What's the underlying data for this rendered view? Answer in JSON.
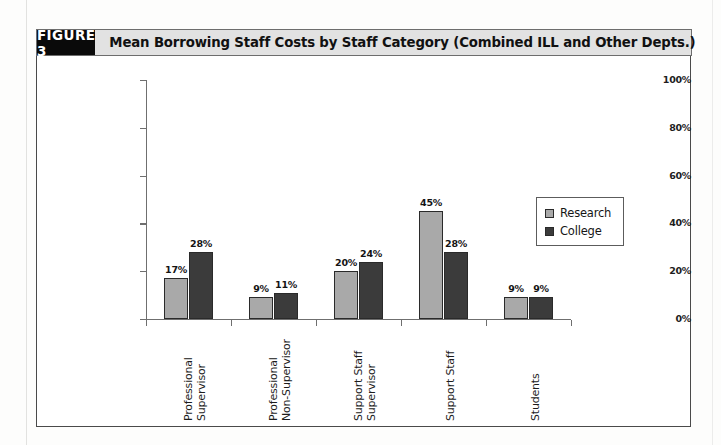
{
  "figure": {
    "number_label": "FIGURE 3",
    "title": "Mean Borrowing Staff Costs by Staff Category (Combined ILL and Other Depts.)"
  },
  "colors": {
    "research_bar": "#a9a9a9",
    "college_bar": "#3b3b3b",
    "header_number_bg": "#0a0a0a",
    "header_title_bg": "#e2e2e2",
    "axis": "#6f6f6f",
    "frame_border": "#4a4a4a"
  },
  "legend": {
    "position": "right-middle",
    "entries": [
      {
        "label": "Research",
        "swatch": "research"
      },
      {
        "label": "College",
        "swatch": "college"
      }
    ]
  },
  "chart_data": {
    "type": "bar",
    "title": "Mean Borrowing Staff Costs by Staff Category (Combined ILL and Other Depts.)",
    "xlabel": "",
    "ylabel": "",
    "ylim": [
      0,
      100
    ],
    "yticks": [
      0,
      20,
      40,
      60,
      80,
      100
    ],
    "ytick_labels": [
      "0%",
      "20%",
      "40%",
      "60%",
      "80%",
      "100%"
    ],
    "grid": false,
    "legend_position": "right-middle",
    "categories": [
      "Professional Supervisor",
      "Professional Non-Supervisor",
      "Support Staff Supervisor",
      "Support Staff",
      "Students"
    ],
    "category_lines": [
      [
        "Professional",
        "Supervisor"
      ],
      [
        "Professional",
        "Non-Supervisor"
      ],
      [
        "Support Staff",
        "Supervisor"
      ],
      [
        "Support Staff"
      ],
      [
        "Students"
      ]
    ],
    "series": [
      {
        "name": "Research",
        "color": "#a9a9a9",
        "values": [
          17,
          9,
          20,
          45,
          9
        ],
        "value_labels": [
          "17%",
          "9%",
          "20%",
          "45%",
          "9%"
        ]
      },
      {
        "name": "College",
        "color": "#3b3b3b",
        "values": [
          28,
          11,
          24,
          28,
          9
        ],
        "value_labels": [
          "28%",
          "11%",
          "24%",
          "28%",
          "9%"
        ]
      }
    ]
  }
}
